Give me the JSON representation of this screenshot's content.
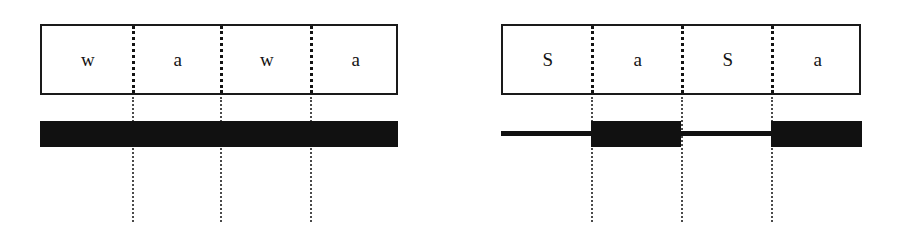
{
  "figure": {
    "title": "",
    "background_color": "#ffffff",
    "ink_color": "#111111",
    "width": 897,
    "height": 245,
    "panels": [
      {
        "id": "left",
        "name": "wawa-panel",
        "box": {
          "x": 40,
          "y": 24,
          "width": 358,
          "height": 71
        },
        "segments": [
          {
            "label": "w",
            "x": 40,
            "width": 92
          },
          {
            "label": "a",
            "x": 132,
            "width": 88
          },
          {
            "label": "w",
            "x": 220,
            "width": 90
          },
          {
            "label": "a",
            "x": 310,
            "width": 88
          }
        ],
        "boundaries": [
          {
            "x": 132,
            "y_top": 26,
            "y_bottom": 93,
            "style": "thick"
          },
          {
            "x": 220,
            "y_top": 26,
            "y_bottom": 93,
            "style": "thick"
          },
          {
            "x": 310,
            "y_top": 26,
            "y_bottom": 93,
            "style": "thick"
          },
          {
            "x": 132,
            "y_top": 97,
            "y_bottom": 222,
            "style": "thin"
          },
          {
            "x": 220,
            "y_top": 97,
            "y_bottom": 222,
            "style": "thin"
          },
          {
            "x": 310,
            "y_top": 97,
            "y_bottom": 222,
            "style": "thin"
          }
        ],
        "waveform": {
          "baseline_y": 134,
          "segments": [
            {
              "kind": "block",
              "x": 40,
              "width": 358,
              "y": 121,
              "height": 26
            }
          ]
        }
      },
      {
        "id": "right",
        "name": "sasa-panel",
        "box": {
          "x": 501,
          "y": 24,
          "width": 360,
          "height": 71
        },
        "segments": [
          {
            "label": "S",
            "x": 501,
            "width": 90
          },
          {
            "label": "a",
            "x": 591,
            "width": 90
          },
          {
            "label": "S",
            "x": 681,
            "width": 90
          },
          {
            "label": "a",
            "x": 771,
            "width": 90
          }
        ],
        "boundaries": [
          {
            "x": 591,
            "y_top": 26,
            "y_bottom": 93,
            "style": "thick"
          },
          {
            "x": 681,
            "y_top": 26,
            "y_bottom": 93,
            "style": "thick"
          },
          {
            "x": 771,
            "y_top": 26,
            "y_bottom": 93,
            "style": "thick"
          },
          {
            "x": 591,
            "y_top": 97,
            "y_bottom": 222,
            "style": "thin"
          },
          {
            "x": 681,
            "y_top": 97,
            "y_bottom": 222,
            "style": "thin"
          },
          {
            "x": 771,
            "y_top": 97,
            "y_bottom": 222,
            "style": "thin"
          }
        ],
        "waveform": {
          "baseline_y": 134,
          "segments": [
            {
              "kind": "line",
              "x": 501,
              "width": 90,
              "y": 131,
              "height": 5
            },
            {
              "kind": "block",
              "x": 591,
              "width": 90,
              "y": 121,
              "height": 26
            },
            {
              "kind": "line",
              "x": 681,
              "width": 90,
              "y": 131,
              "height": 5
            },
            {
              "kind": "block",
              "x": 771,
              "width": 91,
              "y": 121,
              "height": 26
            }
          ]
        }
      }
    ]
  }
}
